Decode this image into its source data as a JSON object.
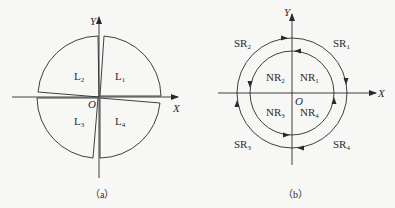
{
  "figure_a": {
    "caption": "（a）",
    "axis_x": "X",
    "axis_y": "Y",
    "origin": "O",
    "regions": [
      {
        "base": "L",
        "sub": "1"
      },
      {
        "base": "L",
        "sub": "2"
      },
      {
        "base": "L",
        "sub": "3"
      },
      {
        "base": "L",
        "sub": "4"
      }
    ]
  },
  "figure_b": {
    "caption": "（b）",
    "axis_x": "X",
    "axis_y": "Y",
    "origin": "O",
    "inner_regions": [
      {
        "base": "NR",
        "sub": "1"
      },
      {
        "base": "NR",
        "sub": "2"
      },
      {
        "base": "NR",
        "sub": "3"
      },
      {
        "base": "NR",
        "sub": "4"
      }
    ],
    "outer_regions": [
      {
        "base": "SR",
        "sub": "1"
      },
      {
        "base": "SR",
        "sub": "2"
      },
      {
        "base": "SR",
        "sub": "3"
      },
      {
        "base": "SR",
        "sub": "4"
      }
    ],
    "outer_direction": "clockwise",
    "inner_direction": "counter-clockwise"
  },
  "colors": {
    "line": "#2a2a2a",
    "background": "#f7f7f5"
  }
}
